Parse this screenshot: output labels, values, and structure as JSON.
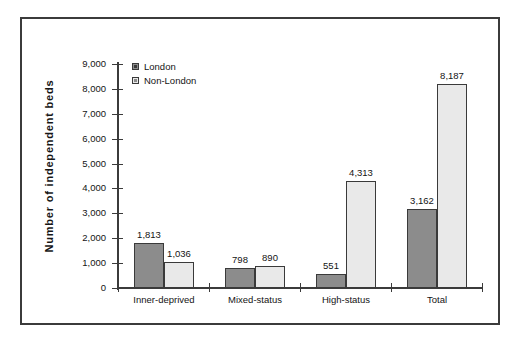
{
  "chart_data": {
    "type": "bar",
    "title": "",
    "xlabel": "",
    "ylabel": "Number  of  independent  beds",
    "categories": [
      "Inner-deprived",
      "Mixed-status",
      "High-status",
      "Total"
    ],
    "series": [
      {
        "name": "London",
        "values": [
          1813,
          798,
          551,
          3162
        ],
        "color": "#8c8c8c"
      },
      {
        "name": "Non-London",
        "values": [
          1036,
          890,
          4313,
          8187
        ],
        "color": "#e9e9e9"
      }
    ],
    "value_labels": [
      [
        "1,813",
        "798",
        "551",
        "3,162"
      ],
      [
        "1,036",
        "890",
        "4,313",
        "8,187"
      ]
    ],
    "ylim": [
      0,
      9000
    ],
    "ytick_labels": [
      "0",
      "1,000",
      "2,000",
      "3,000",
      "4,000",
      "5,000",
      "6,000",
      "7,000",
      "8,000",
      "9,000"
    ],
    "ytick_values": [
      0,
      1000,
      2000,
      3000,
      4000,
      5000,
      6000,
      7000,
      8000,
      9000
    ],
    "grid": false,
    "legend_position": "top-left-inside",
    "legend": [
      "London",
      "Non-London"
    ]
  }
}
